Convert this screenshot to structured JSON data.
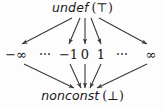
{
  "diagram": {
    "type": "lattice-hasse-diagram",
    "background_color": "#fdfdfd",
    "text_color": "#17171a",
    "edge_color": "#3a3a3e",
    "top": {
      "name": "undef",
      "symbol": "(⊤)",
      "full_label": "undef (⊤)"
    },
    "bottom": {
      "name": "nonconst",
      "symbol": "(⊥)",
      "full_label": "nonconst (⊥)"
    },
    "middle": [
      {
        "label": "−∞",
        "kind": "value",
        "x": 16
      },
      {
        "label": "⋯",
        "kind": "ellipsis",
        "x": 45
      },
      {
        "label": "−1",
        "kind": "value",
        "x": 68
      },
      {
        "label": "0",
        "kind": "value",
        "x": 85
      },
      {
        "label": "1",
        "kind": "value",
        "x": 101
      },
      {
        "label": "⋯",
        "kind": "ellipsis",
        "x": 122
      },
      {
        "label": "∞",
        "kind": "value",
        "x": 151
      }
    ],
    "edges_from_top": [
      {
        "from": "undef",
        "to": "−∞"
      },
      {
        "from": "undef",
        "to": "−1"
      },
      {
        "from": "undef",
        "to": "0"
      },
      {
        "from": "undef",
        "to": "1"
      },
      {
        "from": "undef",
        "to": "∞"
      }
    ],
    "edges_to_bottom": [
      {
        "from": "−∞",
        "to": "nonconst"
      },
      {
        "from": "−1",
        "to": "nonconst"
      },
      {
        "from": "0",
        "to": "nonconst"
      },
      {
        "from": "1",
        "to": "nonconst"
      },
      {
        "from": "∞",
        "to": "nonconst"
      }
    ]
  }
}
